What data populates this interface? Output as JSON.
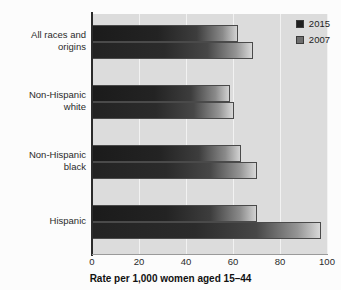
{
  "chart_data": {
    "type": "bar",
    "orientation": "horizontal",
    "title": "",
    "xlabel": "Rate per 1,000 women aged 15–44",
    "ylabel": "",
    "xlim": [
      0,
      100
    ],
    "xticks": [
      0,
      20,
      40,
      60,
      80,
      100
    ],
    "xtick_labels": [
      "0",
      "20",
      "40",
      "60",
      "80",
      "100"
    ],
    "grid": true,
    "grid_axis": "x",
    "legend_position": "top-right",
    "categories": [
      "All races and origins",
      "Non-Hispanic white",
      "Non-Hispanic black",
      "Hispanic"
    ],
    "category_lines": [
      [
        "All races and",
        "origins"
      ],
      [
        "Non-Hispanic",
        "white"
      ],
      [
        "Non-Hispanic",
        "black"
      ],
      [
        "Hispanic"
      ]
    ],
    "series": [
      {
        "name": "2015",
        "color": "#1f1f1f",
        "values": [
          62.0,
          58.7,
          63.2,
          70.0
        ]
      },
      {
        "name": "2007",
        "color": "#4a4a4a",
        "values": [
          68.5,
          60.4,
          70.2,
          97.5
        ]
      }
    ]
  },
  "legend": {
    "items": [
      {
        "label": "2015",
        "swatch": "#1f1f1f"
      },
      {
        "label": "2007",
        "swatch": "#6e6e6e"
      }
    ]
  },
  "axis": {
    "x_title": "Rate per 1,000 women aged 15–44",
    "x_tick_labels": [
      "0",
      "20",
      "40",
      "60",
      "80",
      "100"
    ]
  },
  "colors": {
    "plot_background": "#dcdcdc",
    "page_background": "#fcfcfc",
    "gridline": "#f2f2f2",
    "axis_line": "#2b2b2b",
    "bar_dark": "#1b1b1b",
    "bar_light": "#d2d2d2"
  }
}
